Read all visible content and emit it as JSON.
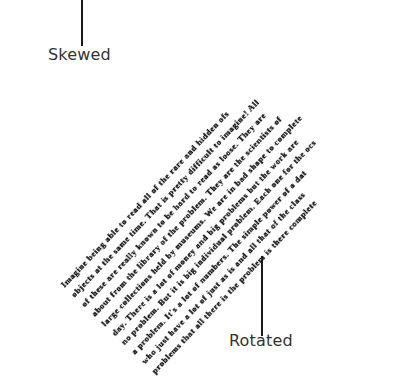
{
  "labels": {
    "skewed": "Skewed",
    "rotated": "Rotated"
  },
  "document_text": {
    "lines": [
      "Imagine being able to read all of the rare and hidden ofs",
      "objects at the same time. That is pretty difficult to imagine! All",
      "of these are really known to be hard to read as loose. They are",
      "about from the library of the problem. They are the scientists of",
      "large collections held by museums. We are in bad shape to complete",
      "day. There is a lot of money and big problems but the work are",
      "no problem. But it is big individual problem. Each one for the ocs",
      "a problem. It's a lot of numbers. The simple power of a dat",
      "who just have a lot of just as is and all that of the class",
      "problems that all there is the problem is there complete"
    ]
  }
}
